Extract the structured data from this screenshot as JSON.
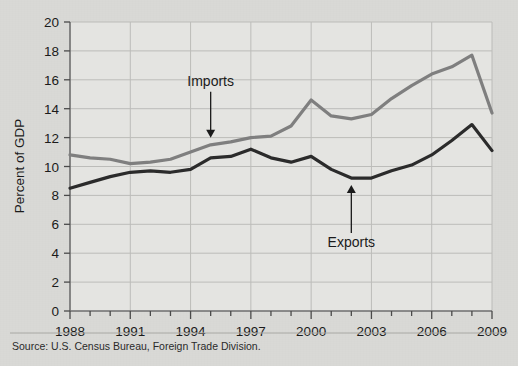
{
  "figure": {
    "source_note": "Source: U.S. Census Bureau, Foreign Trade Division.",
    "background_color": "#d9d9d6",
    "plot_background_color": "#e4e4e1"
  },
  "chart_data": {
    "type": "line",
    "title": "",
    "subtitle": "",
    "xlabel": "",
    "ylabel": "Percent of GDP",
    "xlim": [
      1988,
      2009
    ],
    "ylim": [
      0,
      20
    ],
    "grid": true,
    "legend_position": "inline-annotations",
    "x": [
      1988,
      1989,
      1990,
      1991,
      1992,
      1993,
      1994,
      1995,
      1996,
      1997,
      1998,
      1999,
      2000,
      2001,
      2002,
      2003,
      2004,
      2005,
      2006,
      2007,
      2008,
      2009
    ],
    "xticks": [
      1988,
      1989,
      1990,
      1991,
      1992,
      1993,
      1994,
      1995,
      1996,
      1997,
      1998,
      1999,
      2000,
      2001,
      2002,
      2003,
      2004,
      2005,
      2006,
      2007,
      2008,
      2009
    ],
    "xticklabels": [
      "1988",
      "",
      "",
      "1991",
      "",
      "",
      "1994",
      "",
      "",
      "1997",
      "",
      "",
      "2000",
      "",
      "",
      "2003",
      "",
      "",
      "2006",
      "",
      "",
      "2009"
    ],
    "xtick_labeled_years": [
      1988,
      1991,
      1994,
      1997,
      2000,
      2003,
      2006,
      2009
    ],
    "yticks": [
      0,
      2,
      4,
      6,
      8,
      10,
      12,
      14,
      16,
      18,
      20
    ],
    "yticklabels": [
      "0",
      "2",
      "4",
      "6",
      "8",
      "10",
      "12",
      "14",
      "16",
      "18",
      "20"
    ],
    "series": [
      {
        "name": "Imports",
        "color": "#7f7f7f",
        "line_width": 3.2,
        "values": [
          10.8,
          10.6,
          10.5,
          10.2,
          10.3,
          10.5,
          11.0,
          11.5,
          11.7,
          12.0,
          12.1,
          12.8,
          14.6,
          13.5,
          13.3,
          13.6,
          14.7,
          15.6,
          16.4,
          16.9,
          17.7,
          13.7
        ]
      },
      {
        "name": "Exports",
        "color": "#2b2b2b",
        "line_width": 3.2,
        "values": [
          8.5,
          8.9,
          9.3,
          9.6,
          9.7,
          9.6,
          9.8,
          10.6,
          10.7,
          11.2,
          10.6,
          10.3,
          10.7,
          9.8,
          9.2,
          9.2,
          9.7,
          10.1,
          10.8,
          11.8,
          12.9,
          11.1
        ]
      }
    ],
    "annotations": [
      {
        "text": "Imports",
        "points_to_series": "Imports",
        "points_to_year": 1995,
        "arrow_direction": "down"
      },
      {
        "text": "Exports",
        "points_to_series": "Exports",
        "points_to_year": 2002,
        "arrow_direction": "up"
      }
    ]
  }
}
